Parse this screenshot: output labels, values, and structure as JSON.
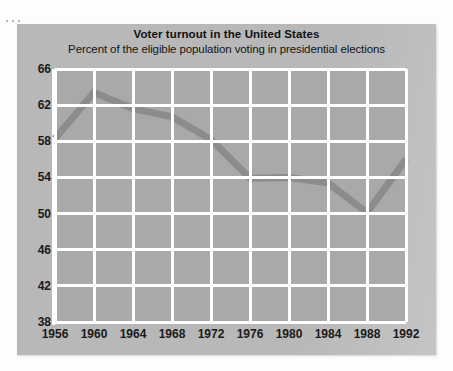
{
  "page": {
    "background": "#fdfdfd",
    "corner_dots": 3
  },
  "panel": {
    "background": "#b8b8b8"
  },
  "chart_data": {
    "type": "line",
    "title": "Voter turnout in the United States",
    "subtitle": "Percent of the eligible population voting in presidential elections",
    "xlabel": "",
    "ylabel": "",
    "x": [
      1956,
      1960,
      1964,
      1968,
      1972,
      1976,
      1980,
      1984,
      1988,
      1992
    ],
    "values": [
      58.3,
      63.4,
      61.6,
      60.7,
      58.2,
      53.9,
      54.0,
      53.4,
      50.1,
      56.0
    ],
    "series": [
      {
        "name": "Voter turnout",
        "values": [
          58.3,
          63.4,
          61.6,
          60.7,
          58.2,
          53.9,
          54.0,
          53.4,
          50.1,
          56.0
        ],
        "color": "#8c8c8c"
      }
    ],
    "xticklabels": [
      "1956",
      "1960",
      "1964",
      "1968",
      "1972",
      "1976",
      "1980",
      "1984",
      "1988",
      "1992"
    ],
    "yticks": [
      66,
      62,
      58,
      54,
      50,
      46,
      42,
      38
    ],
    "yticklabels": [
      "66",
      "62",
      "58",
      "54",
      "50",
      "46",
      "42",
      "38"
    ],
    "ylim": [
      38,
      66
    ],
    "xlim": [
      1956,
      1992
    ],
    "grid": true,
    "grid_color": "#ffffff",
    "plot_background": "#a9a9a9",
    "legend": false,
    "legend_position": "none",
    "line_color": "#8c8c8c",
    "line_width": 7
  }
}
